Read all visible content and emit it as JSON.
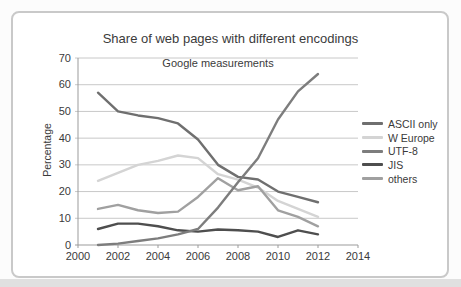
{
  "chart_data": {
    "type": "line",
    "title": "Share of web pages with different encodings",
    "subtitle": "Google measurements",
    "xlabel": "",
    "ylabel": "Percentage",
    "xlim": [
      2000,
      2014
    ],
    "ylim": [
      0,
      70
    ],
    "xticks": [
      2000,
      2002,
      2004,
      2006,
      2008,
      2010,
      2012,
      2014
    ],
    "yticks": [
      0,
      10,
      20,
      30,
      40,
      50,
      60,
      70
    ],
    "grid": "horizontal",
    "legend_position": "right",
    "x": [
      2001,
      2002,
      2003,
      2004,
      2005,
      2006,
      2007,
      2008,
      2009,
      2010,
      2011,
      2012
    ],
    "series": [
      {
        "name": "ASCII only",
        "color": "#6f6f6f",
        "values": [
          57,
          50,
          48.5,
          47.5,
          45.5,
          39.5,
          30,
          25.5,
          24.5,
          20,
          18,
          16
        ]
      },
      {
        "name": "W Europe",
        "color": "#d4d4d4",
        "values": [
          24,
          27,
          30,
          31.5,
          33.5,
          32.5,
          26.5,
          24.5,
          21.5,
          16.5,
          13.5,
          10.5
        ]
      },
      {
        "name": "UTF-8",
        "color": "#7d7d7d",
        "values": [
          0,
          0.5,
          1.5,
          2.5,
          4,
          6,
          14,
          23.5,
          32.5,
          47,
          57.5,
          64
        ]
      },
      {
        "name": "JIS",
        "color": "#4e4e4e",
        "values": [
          6,
          8,
          8,
          7,
          5.5,
          5,
          5.8,
          5.5,
          5,
          3,
          5.5,
          4
        ]
      },
      {
        "name": "others",
        "color": "#a0a0a0",
        "values": [
          13.5,
          15,
          13,
          12,
          12.5,
          18,
          25,
          20.5,
          22,
          13,
          10.5,
          7
        ]
      }
    ],
    "draw_order": [
      1,
      4,
      0,
      3,
      2
    ],
    "colors": {
      "gridline": "#c8c8c8",
      "axis": "#9b9b9b",
      "frame_border": "#c9c9c9",
      "text": "#3a3a3a",
      "background": "#ffffff"
    }
  }
}
